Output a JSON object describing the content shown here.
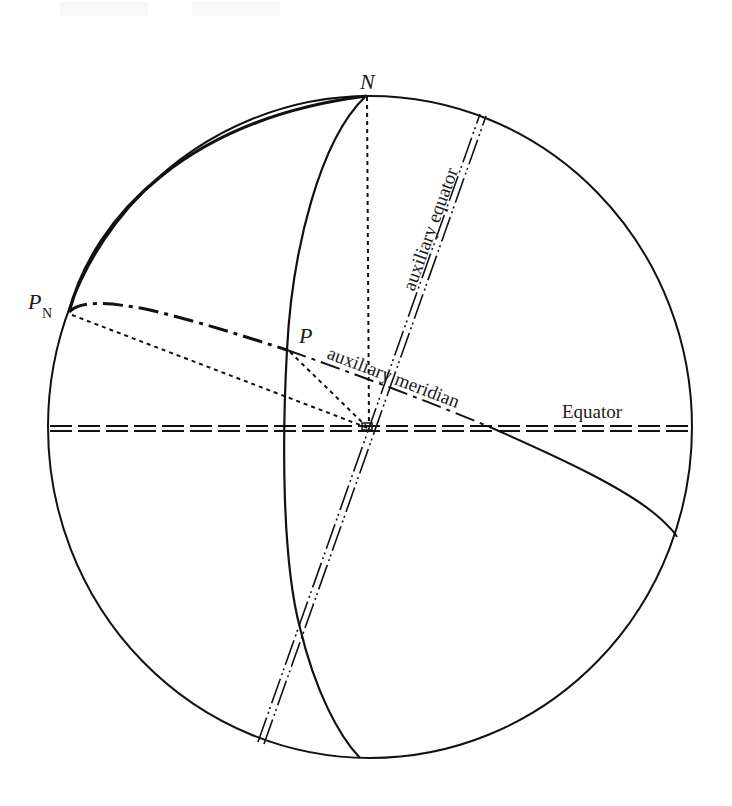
{
  "figure": {
    "type": "celestial-sphere-diagram",
    "colors": {
      "background": "#ffffff",
      "ink": "#111111"
    }
  },
  "labels": {
    "north_pole": "N",
    "pole_n_main": "P",
    "pole_n_sub": "N",
    "point_p": "P",
    "auxiliary_meridian": "auxiliary meridian",
    "auxiliary_equator": "auxiliary equator",
    "equator": "Equator"
  },
  "elements": [
    {
      "name": "sphere-outline",
      "style": "solid"
    },
    {
      "name": "great-circle-arc-pn-n",
      "style": "solid-bold"
    },
    {
      "name": "meridian-n-through-p",
      "style": "solid"
    },
    {
      "name": "equator-line",
      "style": "double-dashed"
    },
    {
      "name": "auxiliary-equator-line",
      "style": "double-dash-dot-dot"
    },
    {
      "name": "auxiliary-meridian-curve",
      "style": "dash-dot then solid"
    },
    {
      "name": "axis-n-to-center",
      "style": "dotted"
    },
    {
      "name": "pn-to-center",
      "style": "dotted"
    },
    {
      "name": "p-to-center",
      "style": "dotted"
    }
  ]
}
